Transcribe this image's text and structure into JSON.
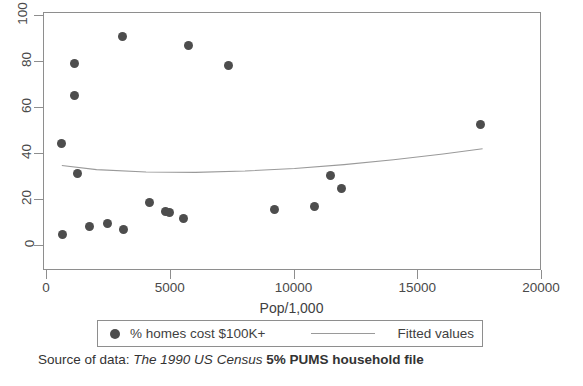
{
  "chart_data": {
    "type": "scatter",
    "title": "",
    "xlabel": "Pop/1,000",
    "ylabel": "",
    "xlim": [
      0,
      20000
    ],
    "ylim": [
      0,
      100
    ],
    "xticks": [
      0,
      5000,
      10000,
      15000,
      20000
    ],
    "xtick_labels": [
      "0",
      "5000",
      "10000",
      "15000",
      "20000"
    ],
    "yticks": [
      0,
      20,
      40,
      60,
      80,
      100
    ],
    "ytick_labels": [
      "0",
      "20",
      "40",
      "60",
      "80",
      "100"
    ],
    "grid": false,
    "legend_position": "below-axis",
    "series": [
      {
        "name": "% homes cost $100K+",
        "type": "scatter",
        "marker": "filled-circle",
        "color": "#4d4d4d",
        "points": [
          {
            "x": 600,
            "y": 44.5
          },
          {
            "x": 620,
            "y": 5.0
          },
          {
            "x": 1100,
            "y": 79.5
          },
          {
            "x": 1120,
            "y": 65.5
          },
          {
            "x": 1250,
            "y": 31.5
          },
          {
            "x": 1700,
            "y": 8.5
          },
          {
            "x": 2450,
            "y": 10.0
          },
          {
            "x": 3050,
            "y": 91.0
          },
          {
            "x": 3100,
            "y": 7.0
          },
          {
            "x": 4150,
            "y": 19.0
          },
          {
            "x": 4800,
            "y": 15.0
          },
          {
            "x": 4950,
            "y": 14.5
          },
          {
            "x": 5500,
            "y": 12.0
          },
          {
            "x": 5700,
            "y": 87.0
          },
          {
            "x": 7350,
            "y": 78.5
          },
          {
            "x": 9200,
            "y": 16.0
          },
          {
            "x": 10800,
            "y": 17.0
          },
          {
            "x": 11450,
            "y": 30.5
          },
          {
            "x": 11900,
            "y": 25.0
          },
          {
            "x": 17500,
            "y": 53.0
          }
        ]
      },
      {
        "name": "Fitted values",
        "type": "line",
        "color": "#9a9a9a",
        "points": [
          {
            "x": 600,
            "y": 35.0
          },
          {
            "x": 2000,
            "y": 33.2
          },
          {
            "x": 4000,
            "y": 32.2
          },
          {
            "x": 6000,
            "y": 32.0
          },
          {
            "x": 8000,
            "y": 32.6
          },
          {
            "x": 10000,
            "y": 33.7
          },
          {
            "x": 12000,
            "y": 35.4
          },
          {
            "x": 14000,
            "y": 37.5
          },
          {
            "x": 16000,
            "y": 40.0
          },
          {
            "x": 17600,
            "y": 42.3
          }
        ]
      }
    ]
  },
  "legend": {
    "entries": [
      {
        "label": "% homes cost $100K+",
        "marker": "filled-circle"
      },
      {
        "label": "Fitted values",
        "marker": "line"
      }
    ]
  },
  "axis": {
    "x_title": "Pop/1,000"
  },
  "source": {
    "prefix": "Source of data:",
    "italic": "The 1990 US Census",
    "bold": "5% PUMS household file"
  },
  "colors": {
    "marker": "#4d4d4d",
    "fit_line": "#9a9a9a",
    "frame": "#8e8e8e",
    "text": "#3a3a3a",
    "background": "#ffffff"
  }
}
